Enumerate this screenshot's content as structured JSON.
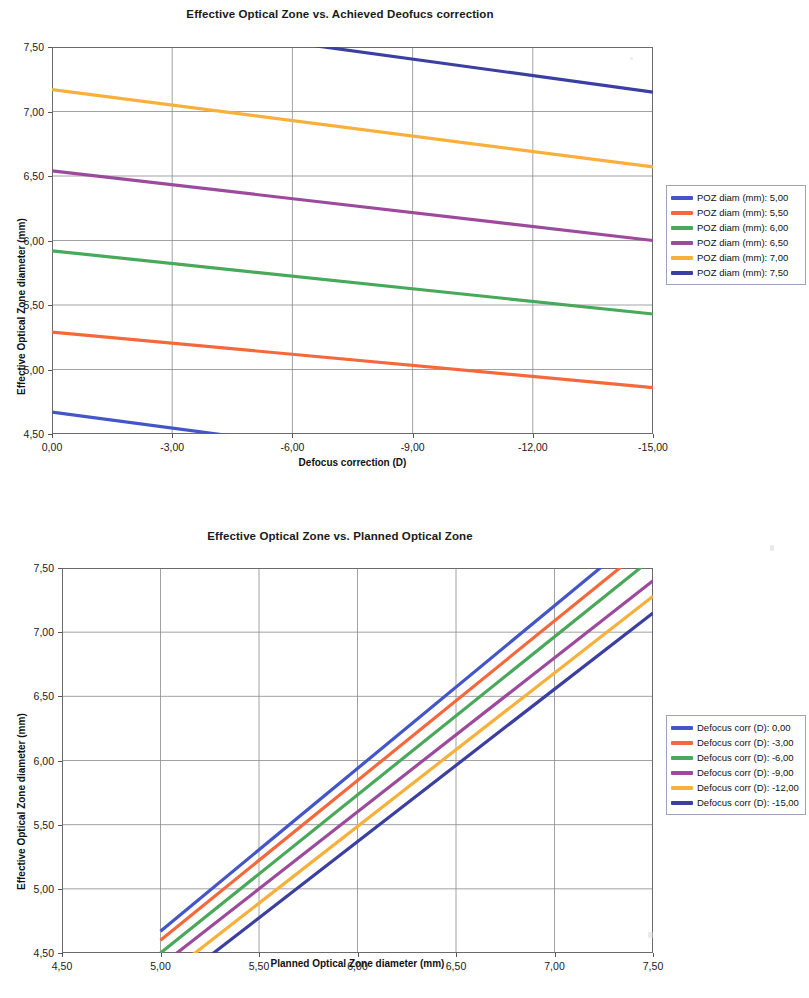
{
  "document": {
    "kind": "scanned-figure-page",
    "charts": 2
  },
  "chart_data": [
    {
      "type": "line",
      "title": "Effective Optical Zone vs. Achieved Deofucs correction",
      "xlabel": "Defocus correction (D)",
      "ylabel": "Effective Optical Zone diameter (mm)",
      "xlim": [
        0,
        -15
      ],
      "ylim": [
        4.5,
        7.5
      ],
      "xticks": [
        "0,00",
        "-3,00",
        "-6,00",
        "-9,00",
        "-12,00",
        "-15,00"
      ],
      "xtick_values": [
        0,
        -3,
        -6,
        -9,
        -12,
        -15
      ],
      "yticks": [
        "4,50",
        "5,00",
        "5,50",
        "6,00",
        "6,50",
        "7,00",
        "7,50"
      ],
      "ytick_values": [
        4.5,
        5.0,
        5.5,
        6.0,
        6.5,
        7.0,
        7.5
      ],
      "grid": true,
      "legend_position": "right",
      "x": [
        0,
        -15
      ],
      "series": [
        {
          "name": "POZ diam (mm):  5,00",
          "label_prefix": "POZ diam (mm):",
          "label_value": "5,00",
          "color": "#4455c8",
          "values": [
            4.67,
            4.05
          ]
        },
        {
          "name": "POZ diam (mm):  5,50",
          "label_prefix": "POZ diam (mm):",
          "label_value": "5,50",
          "color": "#f4693c",
          "values": [
            5.29,
            4.86
          ]
        },
        {
          "name": "POZ diam (mm):  6,00",
          "label_prefix": "POZ diam (mm):",
          "label_value": "6,00",
          "color": "#4aa85a",
          "values": [
            5.92,
            5.43
          ]
        },
        {
          "name": "POZ diam (mm):  6,50",
          "label_prefix": "POZ diam (mm):",
          "label_value": "6,50",
          "color": "#9c4a9c",
          "values": [
            6.54,
            6.0
          ]
        },
        {
          "name": "POZ diam (mm):  7,00",
          "label_prefix": "POZ diam (mm):",
          "label_value": "7,00",
          "color": "#f8b03c",
          "values": [
            7.17,
            6.57
          ]
        },
        {
          "name": "POZ diam (mm):  7,50",
          "label_prefix": "POZ diam (mm):",
          "label_value": "7,50",
          "color": "#3b3fa0",
          "values": [
            7.79,
            7.15
          ]
        }
      ]
    },
    {
      "type": "line",
      "title": "Effective Optical Zone vs. Planned Optical Zone",
      "xlabel": "Planned Optical Zone diameter (mm)",
      "ylabel": "Effective Optical Zone diameter (mm)",
      "xlim": [
        4.5,
        7.5
      ],
      "ylim": [
        4.5,
        7.5
      ],
      "xticks": [
        "4,50",
        "5,00",
        "5,50",
        "6,00",
        "6,50",
        "7,00",
        "7,50"
      ],
      "xtick_values": [
        4.5,
        5.0,
        5.5,
        6.0,
        6.5,
        7.0,
        7.5
      ],
      "yticks": [
        "4,50",
        "5,00",
        "5,50",
        "6,00",
        "6,50",
        "7,00",
        "7,50"
      ],
      "ytick_values": [
        4.5,
        5.0,
        5.5,
        6.0,
        6.5,
        7.0,
        7.5
      ],
      "grid": true,
      "legend_position": "right",
      "x": [
        5.0,
        7.5
      ],
      "series": [
        {
          "name": "Defocus corr (D):  0,00",
          "label_prefix": "Defocus corr (D):",
          "label_value": "0,00",
          "color": "#4455c8",
          "values": [
            4.67,
            7.84
          ]
        },
        {
          "name": "Defocus corr (D):  -3,00",
          "label_prefix": "Defocus corr (D):",
          "label_value": "-3,00",
          "color": "#f4693c",
          "values": [
            4.6,
            7.71
          ]
        },
        {
          "name": "Defocus corr (D):  -6,00",
          "label_prefix": "Defocus corr (D):",
          "label_value": "-6,00",
          "color": "#4aa85a",
          "values": [
            4.5,
            7.58
          ]
        },
        {
          "name": "Defocus corr (D):  -9,00",
          "label_prefix": "Defocus corr (D):",
          "label_value": "-9,00",
          "color": "#9c4a9c",
          "values": [
            4.4,
            7.4
          ]
        },
        {
          "name": "Defocus corr (D):  -12,00",
          "label_prefix": "Defocus corr (D):",
          "label_value": "-12,00",
          "color": "#f8b03c",
          "values": [
            4.29,
            7.28
          ]
        },
        {
          "name": "Defocus corr (D):  -15,00",
          "label_prefix": "Defocus corr (D):",
          "label_value": "-15,00",
          "color": "#3b3fa0",
          "values": [
            4.18,
            7.15
          ]
        }
      ]
    }
  ]
}
